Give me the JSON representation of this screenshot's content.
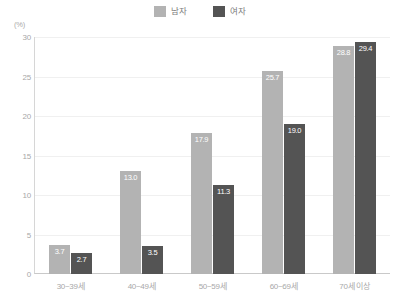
{
  "chart_data": {
    "type": "bar",
    "title": "",
    "subtitle": "",
    "xlabel": "",
    "ylabel": "",
    "unit_label": "(%)",
    "categories": [
      "30~39세",
      "40~49세",
      "50~59세",
      "60~69세",
      "70세 이상"
    ],
    "series": [
      {
        "name": "남자",
        "color": "#b3b3b3",
        "values": [
          3.7,
          13.0,
          17.9,
          25.7,
          28.8
        ],
        "labels": [
          "3.7",
          "13.0",
          "17.9",
          "25.7",
          "28.8"
        ]
      },
      {
        "name": "여자",
        "color": "#545454",
        "values": [
          2.7,
          3.5,
          11.3,
          19.0,
          29.4
        ],
        "labels": [
          "2.7",
          "3.5",
          "11.3",
          "19.0",
          "29.4"
        ]
      }
    ],
    "ylim": [
      0,
      30
    ],
    "yticks": [
      30,
      25,
      20,
      15,
      10,
      5,
      0
    ],
    "ytick_labels": [
      "30",
      "25",
      "20",
      "15",
      "10",
      "5",
      "0"
    ],
    "grid": true,
    "grid_color": "#f0f0f0",
    "legend_position": "top-center",
    "axis_color": "#d6d6d6",
    "label_text_color": "#ffffff",
    "tick_text_color": "#a8a8a8"
  }
}
